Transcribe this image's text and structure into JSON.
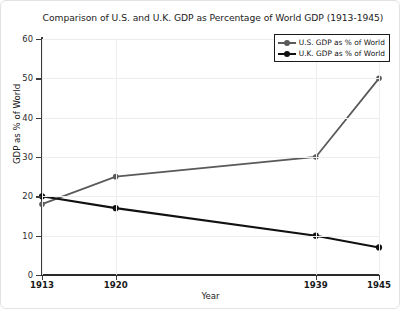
{
  "chart_data": {
    "type": "line",
    "title": "Comparison of U.S. and U.K. GDP as Percentage of World GDP (1913-1945)",
    "xlabel": "Year",
    "ylabel": "GDP as % of World",
    "x": [
      1913,
      1920,
      1939,
      1945
    ],
    "xtick_labels": [
      "1913",
      "1920",
      "1939",
      "1945"
    ],
    "ytick_labels": [
      "0",
      "10",
      "20",
      "30",
      "40",
      "50",
      "60"
    ],
    "yticks": [
      0,
      10,
      20,
      30,
      40,
      50,
      60
    ],
    "ylim": [
      0,
      60
    ],
    "xlim": [
      1913,
      1945
    ],
    "grid": true,
    "legend_position": "upper right",
    "series": [
      {
        "name": "U.S. GDP as % of World",
        "values": [
          18,
          25,
          30,
          50
        ],
        "color": "#5a5a5a"
      },
      {
        "name": "U.K. GDP as % of World",
        "values": [
          20,
          17,
          10,
          7
        ],
        "color": "#111111"
      }
    ]
  },
  "figure": {
    "background": "#ffffff",
    "grid_color": "#ededed",
    "border_color": "#e2e2e2"
  }
}
